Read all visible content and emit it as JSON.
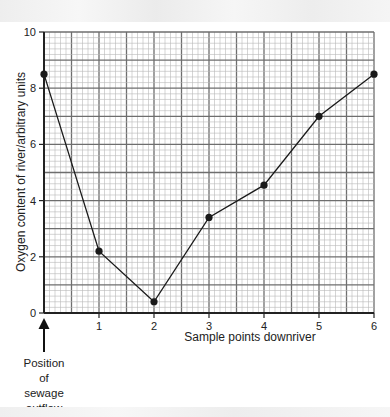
{
  "header": {
    "faded_caption": ""
  },
  "chart_data": {
    "type": "line",
    "title": "",
    "xlabel": "Sample points downriver",
    "ylabel": "Oxygen content of river/arbitrary units",
    "x": [
      0,
      1,
      2,
      3,
      4,
      5,
      6
    ],
    "series": [
      {
        "name": "Oxygen content",
        "values": [
          8.5,
          2.2,
          0.4,
          3.4,
          4.55,
          7.0,
          8.5
        ],
        "color": "#1a1a1a",
        "marker": "circle"
      }
    ],
    "xlim": [
      0,
      6
    ],
    "ylim": [
      0,
      10
    ],
    "xticks": [
      "1",
      "2",
      "3",
      "4",
      "5",
      "6"
    ],
    "yticks": [
      "0",
      "2",
      "4",
      "6",
      "8",
      "10"
    ],
    "grid": true,
    "legend": null,
    "annotations": [
      {
        "text": "Position of sewage outflow",
        "x": 0,
        "arrow": "up",
        "lines": [
          "Position",
          "of",
          "sewage",
          "outflow"
        ]
      }
    ]
  },
  "colors": {
    "grid_minor": "#b8b8b8",
    "grid_major": "#6e6e6e",
    "axis": "#222222",
    "line": "#1a1a1a"
  }
}
